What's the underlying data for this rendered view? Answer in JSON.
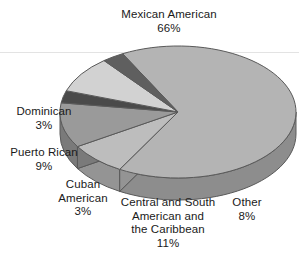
{
  "chart_data": {
    "type": "pie",
    "title": "",
    "subtitle": "",
    "xlabel": "",
    "ylabel": "",
    "legend_position": "none",
    "grid": false,
    "three_d": true,
    "value_unit": "%",
    "categories": [
      "Mexican American",
      "Other",
      "Central and South American and the Caribbean",
      "Cuban American",
      "Puerto Rican",
      "Dominican"
    ],
    "values": [
      66,
      8,
      11,
      3,
      9,
      3
    ],
    "slices": [
      {
        "name": "mexican-american",
        "label_lines": [
          "Mexican American"
        ],
        "value": 66,
        "value_text": "66%",
        "color": "#b4b4b4",
        "side_color": "#8d8d8d"
      },
      {
        "name": "other",
        "label_lines": [
          "Other"
        ],
        "value": 8,
        "value_text": "8%",
        "color": "#bdbdbd",
        "side_color": "#949494"
      },
      {
        "name": "central-and-south-american-and-the-caribbean",
        "label_lines": [
          "Central and South",
          "American and",
          "the Caribbean"
        ],
        "value": 11,
        "value_text": "11%",
        "color": "#9a9a9a",
        "side_color": "#7a7a7a"
      },
      {
        "name": "cuban-american",
        "label_lines": [
          "Cuban",
          "American"
        ],
        "value": 3,
        "value_text": "3%",
        "color": "#4a4a4a",
        "side_color": "#3a3a3a"
      },
      {
        "name": "puerto-rican",
        "label_lines": [
          "Puerto Rican"
        ],
        "value": 9,
        "value_text": "9%",
        "color": "#d2d2d2",
        "side_color": "#a6a6a6"
      },
      {
        "name": "dominican",
        "label_lines": [
          "Dominican"
        ],
        "value": 3,
        "value_text": "3%",
        "color": "#5f5f5f",
        "side_color": "#4b4b4b"
      }
    ],
    "colors": {
      "background": "#ffffff",
      "outline": "#5a5a5a",
      "rule": "#e3e3e3",
      "text": "#1a1a1a"
    }
  },
  "labels": {
    "mexican_american": {
      "l1": "Mexican American",
      "pct": "66%"
    },
    "dominican": {
      "l1": "Dominican",
      "pct": "3%"
    },
    "puerto_rican": {
      "l1": "Puerto Rican",
      "pct": "9%"
    },
    "cuban_american": {
      "l1": "Cuban",
      "l2": "American",
      "pct": "3%"
    },
    "central_south": {
      "l1": "Central and South",
      "l2": "American and",
      "l3": "the Caribbean",
      "pct": "11%"
    },
    "other": {
      "l1": "Other",
      "pct": "8%"
    }
  }
}
